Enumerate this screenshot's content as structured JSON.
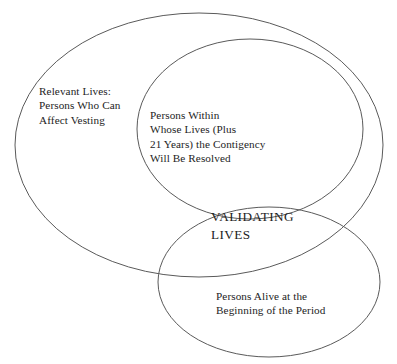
{
  "figure": {
    "type": "venn-diagram",
    "background_color": "#ffffff",
    "stroke_color": "#5a5a5a",
    "text_color": "#1d1d1d",
    "width": 397,
    "height": 364,
    "clipped_top_text": "",
    "sets": [
      {
        "id": "relevant-lives",
        "label": "Relevant Lives:\nPersons Who Can\nAffect Vesting",
        "center_x": 199,
        "center_y": 145,
        "radius_x": 184,
        "radius_y": 132
      },
      {
        "id": "persons-within",
        "label": "Persons Within\nWhose Lives (Plus\n21 Years) the Contigency\nWill Be Resolved",
        "center_x": 250,
        "center_y": 129,
        "radius_x": 113,
        "radius_y": 90
      },
      {
        "id": "persons-alive",
        "label": "Persons Alive at the\nBeginning of the Period",
        "center_x": 269,
        "center_y": 282,
        "radius_x": 111,
        "radius_y": 75
      }
    ],
    "intersection": {
      "id": "validating-lives",
      "label": "VALIDATING\nLIVES"
    }
  }
}
